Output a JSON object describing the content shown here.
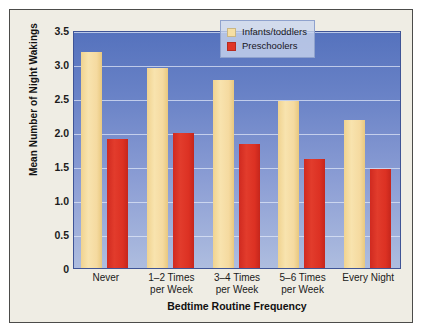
{
  "chart_data": {
    "type": "bar",
    "title": "",
    "xlabel": "Bedtime Routine Frequency",
    "ylabel": "Mean Number of Night Wakings",
    "categories": [
      "Never",
      "1–2 Times\nper Week",
      "3–4 Times\nper Week",
      "5–6 Times\nper Week",
      "Every Night"
    ],
    "series": [
      {
        "name": "Infants/toddlers",
        "color": "#f6dfa3",
        "values": [
          3.17,
          2.94,
          2.77,
          2.45,
          2.18
        ]
      },
      {
        "name": "Preschoolers",
        "color": "#e03528",
        "values": [
          1.89,
          1.98,
          1.82,
          1.6,
          1.46
        ]
      }
    ],
    "ylim": [
      0,
      3.5
    ],
    "yticks": [
      "0",
      "0.5",
      "1.0",
      "1.5",
      "2.0",
      "2.5",
      "3.0",
      "3.5"
    ],
    "ytick_values": [
      0,
      0.5,
      1.0,
      1.5,
      2.0,
      2.5,
      3.0,
      3.5
    ],
    "grid": true,
    "legend_position": "top-right",
    "plot_background_top_color": "#5572bd",
    "plot_background_bottom_color": "#aebddf",
    "card_background_color": "#efede4",
    "border_color": "#4c4c4a"
  },
  "legend": {
    "items": [
      {
        "label": "Infants/toddlers",
        "swatch": "infants-swatch"
      },
      {
        "label": "Preschoolers",
        "swatch": "preschoolers-swatch"
      }
    ]
  },
  "axes": {
    "y_title": "Mean Number of Night Wakings",
    "x_title": "Bedtime Routine Frequency",
    "y_ticks": [
      "3.5",
      "3.0",
      "2.5",
      "2.0",
      "1.5",
      "1.0",
      "0.5",
      "0"
    ],
    "x_ticks": [
      "Never",
      "1–2 Times\nper Week",
      "3–4 Times\nper Week",
      "5–6 Times\nper Week",
      "Every Night"
    ]
  }
}
